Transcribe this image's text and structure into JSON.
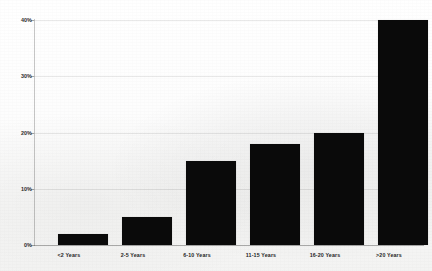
{
  "chart_data": {
    "type": "bar",
    "title": "",
    "subtitle": "",
    "xlabel": "",
    "ylabel": "",
    "categories": [
      "<2 Years",
      "2-5 Years",
      "6-10 Years",
      "11-15 Years",
      "16-20 Years",
      ">20 Years"
    ],
    "values": [
      2,
      5,
      15,
      18,
      20,
      40
    ],
    "value_suffix": "%",
    "ylim": [
      0,
      40
    ],
    "yticks": [
      0,
      10,
      20,
      30,
      40
    ],
    "ytick_labels": [
      "0%",
      "10%",
      "20%",
      "30%",
      "40%"
    ],
    "grid": true,
    "grid_axis": "y",
    "legend": false,
    "legend_position": "none",
    "bar_color": "#0a0a0a",
    "background_color": "#f7f7f6"
  },
  "axes": {
    "y_ticks": [
      {
        "label": "40%",
        "value": 40
      },
      {
        "label": "30%",
        "value": 30
      },
      {
        "label": "20%",
        "value": 20
      },
      {
        "label": "10%",
        "value": 10
      },
      {
        "label": "0%",
        "value": 0
      }
    ],
    "x_categories": [
      {
        "label": "<2 Years"
      },
      {
        "label": "2-5 Years"
      },
      {
        "label": "6-10 Years"
      },
      {
        "label": "11-15 Years"
      },
      {
        "label": "16-20 Years"
      },
      {
        "label": ">20 Years"
      }
    ]
  }
}
